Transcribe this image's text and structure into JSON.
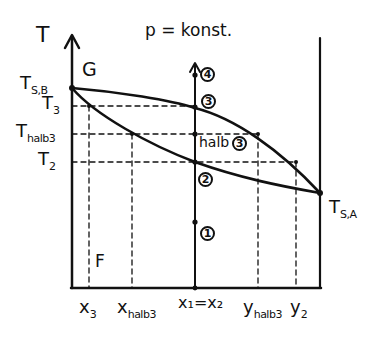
{
  "diagram": {
    "title": "p = konst.",
    "y_axis_label": "T",
    "region_labels": {
      "gas": "G",
      "liquid": "F"
    },
    "y_ticks": [
      {
        "main": "T",
        "sub": "S,B",
        "y": 88
      },
      {
        "main": "T",
        "sub": "3",
        "y": 106
      },
      {
        "main": "T",
        "sub": "halb3",
        "y": 134
      },
      {
        "main": "T",
        "sub": "2",
        "y": 162
      }
    ],
    "x_ticks": [
      {
        "main": "x",
        "sub": "3",
        "x": 89
      },
      {
        "main": "x",
        "sub": "halb3",
        "x": 132
      },
      {
        "main": "x₁=x₂",
        "sub": "",
        "x": 195
      },
      {
        "main": "y",
        "sub": "halb3",
        "x": 258
      },
      {
        "main": "y",
        "sub": "2",
        "x": 296
      }
    ],
    "right_label": {
      "main": "T",
      "sub": "S,A"
    },
    "state_points": [
      {
        "id": "4",
        "label": "4",
        "y": 75
      },
      {
        "id": "3",
        "label": "3",
        "y": 108
      },
      {
        "id": "halb3",
        "prefix": "halb",
        "label": "3",
        "y": 134
      },
      {
        "id": "2",
        "label": "2",
        "y": 162
      },
      {
        "id": "1",
        "label": "1",
        "y": 222
      }
    ],
    "curves": {
      "dew_line": "upper curve from T_S,B to T_S,A",
      "boiling_line": "lower curve from T_S,B to T_S,A"
    },
    "colors": {
      "ink": "#111111",
      "background": "#ffffff"
    }
  }
}
